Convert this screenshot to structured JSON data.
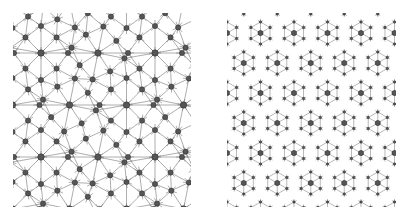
{
  "figure": {
    "panels": [
      {
        "id": "left",
        "description": "quasi-periodic network tiling with nodes and connecting edges",
        "node_color": "#555555",
        "node_stroke": "#333333",
        "edge_color": "#777777"
      },
      {
        "id": "right",
        "description": "dense periodic hexagonal network tiling with nodes and connecting edges",
        "node_color": "#555555",
        "node_stroke": "#333333",
        "edge_color": "#666666"
      }
    ]
  }
}
